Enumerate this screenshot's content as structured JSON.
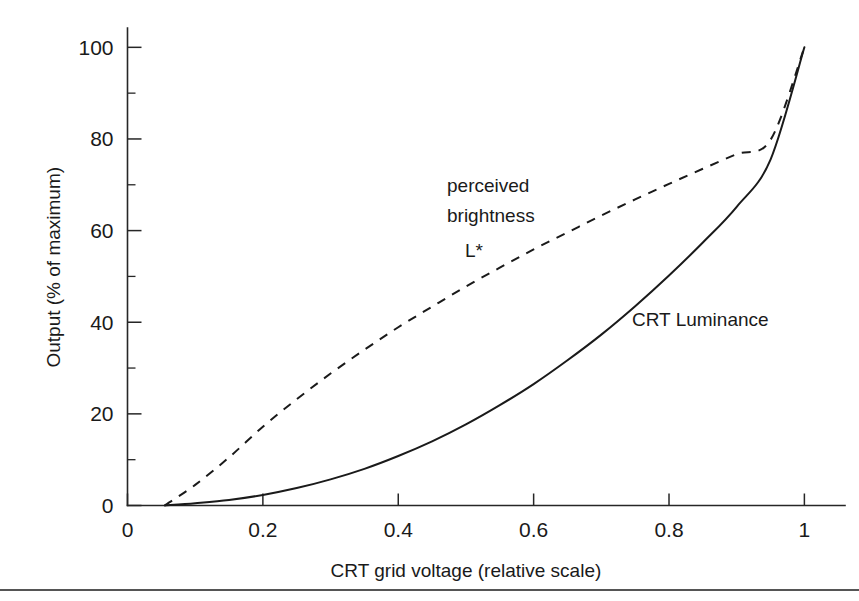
{
  "figure": {
    "background_color": "#ffffff",
    "line_color": "#1a1a1a",
    "rule_color": "#555555"
  },
  "chart_data": {
    "type": "line",
    "title": "",
    "xlabel": "CRT grid voltage (relative scale)",
    "ylabel": "Output (% of maximum)",
    "xlim": [
      0,
      1.06
    ],
    "ylim": [
      0,
      104
    ],
    "grid": false,
    "legend_position": "inline-annotations",
    "x_ticks": [
      "0",
      "0.2",
      "0.4",
      "0.6",
      "0.8",
      "1"
    ],
    "x_tick_values": [
      0,
      0.2,
      0.4,
      0.6,
      0.8,
      1
    ],
    "x_minor_ticks": [],
    "y_ticks": [
      "0",
      "20",
      "40",
      "60",
      "80",
      "100"
    ],
    "y_tick_values": [
      0,
      20,
      40,
      60,
      80,
      100
    ],
    "y_minor_ticks": [
      10,
      30,
      50,
      70,
      90
    ],
    "x": [
      0.055,
      0.1,
      0.15,
      0.2,
      0.25,
      0.3,
      0.35,
      0.4,
      0.45,
      0.5,
      0.55,
      0.6,
      0.65,
      0.7,
      0.75,
      0.8,
      0.85,
      0.9,
      0.95,
      1.0
    ],
    "series": [
      {
        "name": "CRT Luminance",
        "style": "solid",
        "label": "CRT Luminance",
        "label_x": 0.69,
        "label_y": 40,
        "values": [
          0,
          0.5,
          1.2,
          2.3,
          3.8,
          5.7,
          8.0,
          10.8,
          14.0,
          17.7,
          21.9,
          26.5,
          31.7,
          37.3,
          43.5,
          50.2,
          57.4,
          65.2,
          75.5,
          100
        ]
      },
      {
        "name": "perceived brightness L*",
        "style": "dashed",
        "label": "perceived brightness L*",
        "label_line_1": "perceived",
        "label_line_2": "brightness",
        "label_line_3": "L*",
        "label_x": 0.42,
        "label_y": 66,
        "values": [
          0,
          4.5,
          10.5,
          17.2,
          23.2,
          28.8,
          34.0,
          38.9,
          43.4,
          47.8,
          51.9,
          55.9,
          59.6,
          63.3,
          66.8,
          70.2,
          73.5,
          76.7,
          79.8,
          100
        ]
      }
    ]
  },
  "annotations": {
    "perceived_brightness": {
      "line1": "perceived",
      "line2": "brightness",
      "line3": "L*"
    },
    "crt_luminance": {
      "line1": "CRT Luminance"
    }
  }
}
